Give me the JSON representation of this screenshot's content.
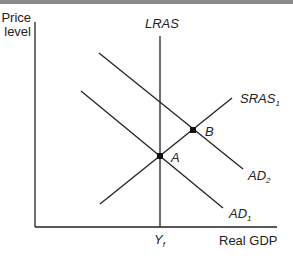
{
  "diagram": {
    "type": "AD-AS model",
    "y_axis_label": [
      "Price",
      "level"
    ],
    "x_axis_label": "Real GDP",
    "x_tick_label": {
      "main": "Y",
      "sub": "f"
    },
    "curves": {
      "lras": {
        "label": "LRAS",
        "sub": ""
      },
      "sras": {
        "label": "SRAS",
        "sub": "1"
      },
      "ad1": {
        "label": "AD",
        "sub": "1"
      },
      "ad2": {
        "label": "AD",
        "sub": "2"
      }
    },
    "points": {
      "a": {
        "label": "A"
      },
      "b": {
        "label": "B"
      }
    },
    "colors": {
      "line": "#222222",
      "topbar": "#8a8a8a"
    }
  }
}
